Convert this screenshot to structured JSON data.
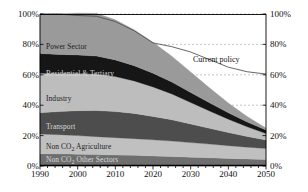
{
  "chart_data": {
    "type": "area",
    "stacked": true,
    "title": "",
    "xlabel": "",
    "ylabel": "",
    "xlim": [
      1990,
      2050
    ],
    "ylim": [
      0,
      100
    ],
    "y_axis_left": {
      "ticks": [
        "0%",
        "20%",
        "40%",
        "60%",
        "80%",
        "100%"
      ],
      "values": [
        0,
        20,
        40,
        60,
        80,
        100
      ]
    },
    "y_axis_right": {
      "ticks": [
        "0%",
        "20%",
        "40%",
        "60%",
        "80%",
        "100%"
      ],
      "values": [
        0,
        20,
        40,
        60,
        80,
        100
      ]
    },
    "x_ticks": [
      "1990",
      "2000",
      "2010",
      "2020",
      "2030",
      "2040",
      "2050"
    ],
    "x_values": [
      1990,
      2000,
      2010,
      2020,
      2030,
      2040,
      2050
    ],
    "grid": true,
    "legend_position": "inline-labels",
    "x": [
      1990,
      1995,
      2000,
      2005,
      2010,
      2015,
      2020,
      2025,
      2030,
      2035,
      2040,
      2045,
      2050
    ],
    "series": [
      {
        "name": "Non CO2 Other Sectors",
        "label": "Non CO",
        "label_sub": "2",
        "label_tail": " Other Sectors",
        "color": "#6e6e6e",
        "label_color": "on-dark",
        "values": [
          8,
          8,
          7.8,
          7.5,
          7.2,
          7,
          6.6,
          6.2,
          5.8,
          5.4,
          5,
          4.6,
          4.2
        ]
      },
      {
        "name": "Non CO2 Agriculture",
        "label": "Non CO",
        "label_sub": "2",
        "label_tail": " Agriculture",
        "color": "#c0c0c0",
        "label_color": "on-light",
        "values": [
          13,
          12.6,
          12.2,
          11.8,
          11.4,
          11,
          10.6,
          10.2,
          9.6,
          9,
          8.4,
          7.8,
          7.3
        ]
      },
      {
        "name": "Transport",
        "label": "Transport",
        "color": "#4d4d4d",
        "label_color": "on-dark",
        "values": [
          14,
          15.2,
          16.4,
          17.2,
          17.2,
          16.6,
          15.4,
          14,
          12.2,
          10.4,
          8.6,
          7,
          5.6
        ]
      },
      {
        "name": "Industry",
        "label": "Industry",
        "color": "#bdbdbd",
        "label_color": "on-light",
        "values": [
          26,
          25,
          24.4,
          24,
          23,
          21.4,
          19.4,
          17,
          14.2,
          11.4,
          8.8,
          6.4,
          4.2
        ]
      },
      {
        "name": "Residential & Tertiary",
        "label": "Residential & Tertiary",
        "color": "#161616",
        "label_color": "on-dark",
        "values": [
          13,
          12.6,
          12.2,
          11.8,
          11,
          10,
          9,
          7.8,
          6.6,
          5.4,
          4.2,
          3.2,
          2.4
        ]
      },
      {
        "name": "Power Sector",
        "label": "Power Sector",
        "color": "#9a9a9a",
        "label_color": "on-light",
        "values": [
          26,
          26.8,
          27.6,
          28.2,
          26.4,
          23.6,
          20.4,
          17,
          13.4,
          9.8,
          6.4,
          3.6,
          1.3
        ]
      }
    ],
    "annotations": [
      {
        "name": "Current policy",
        "label": "Current policy",
        "type": "line",
        "color": "#555555",
        "values": [
          100,
          100,
          99,
          98.5,
          95,
          89,
          81,
          78.5,
          75,
          70,
          65,
          62,
          60.5
        ]
      }
    ]
  },
  "axes": {
    "left_ticks": [
      "100%",
      "80%",
      "60%",
      "40%",
      "20%",
      "0%"
    ],
    "right_ticks": [
      "100%",
      "80%",
      "60%",
      "40%",
      "20%",
      "0%"
    ],
    "x_ticks": [
      "1990",
      "2000",
      "2010",
      "2020",
      "2030",
      "2040",
      "2050"
    ]
  }
}
